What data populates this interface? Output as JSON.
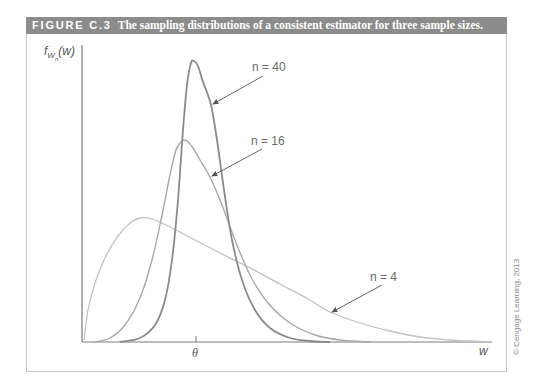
{
  "figure": {
    "number": "FIGURE C.3",
    "title": "The sampling distributions of a consistent estimator for three sample sizes.",
    "copyright": "© Cengage Learning, 2013"
  },
  "axes": {
    "ylabel_main": "f",
    "ylabel_sub": "W",
    "ylabel_subsub": "n",
    "ylabel_arg": "(w)",
    "xlabel": "w",
    "xtick_label": "θ"
  },
  "colors": {
    "header_bg": "#8c8c8c",
    "curve_n40": "#8a8a8a",
    "curve_n16": "#a8a8a8",
    "curve_n4": "#c2c2c2",
    "axis": "#7a7a7a"
  },
  "chart_data": {
    "type": "line",
    "title": "The sampling distributions of a consistent estimator for three sample sizes.",
    "xlabel": "w",
    "ylabel": "f_{W_n}(w)",
    "x_ticks": [
      "θ"
    ],
    "grid": false,
    "legend_position": "inline annotations with arrows",
    "annotations": [
      "n = 40",
      "n = 16",
      "n = 4"
    ],
    "series": [
      {
        "name": "n = 40",
        "label": "n = 40",
        "description": "Tall, narrow density centered at θ",
        "points": [
          [
            120,
            342
          ],
          [
            140,
            338
          ],
          [
            155,
            325
          ],
          [
            165,
            300
          ],
          [
            172,
            260
          ],
          [
            178,
            200
          ],
          [
            183,
            130
          ],
          [
            187,
            85
          ],
          [
            191,
            63
          ],
          [
            194,
            61
          ],
          [
            198,
            66
          ],
          [
            203,
            82
          ],
          [
            211,
            105
          ],
          [
            217,
            140
          ],
          [
            224,
            190
          ],
          [
            232,
            240
          ],
          [
            242,
            280
          ],
          [
            255,
            310
          ],
          [
            270,
            328
          ],
          [
            290,
            338
          ],
          [
            310,
            341
          ],
          [
            330,
            342
          ]
        ]
      },
      {
        "name": "n = 16",
        "label": "n = 16",
        "description": "Moderately peaked density near θ",
        "points": [
          [
            95,
            342
          ],
          [
            110,
            338
          ],
          [
            125,
            325
          ],
          [
            140,
            298
          ],
          [
            152,
            260
          ],
          [
            162,
            215
          ],
          [
            170,
            175
          ],
          [
            176,
            150
          ],
          [
            182,
            141
          ],
          [
            187,
            141
          ],
          [
            193,
            148
          ],
          [
            200,
            160
          ],
          [
            210,
            177
          ],
          [
            222,
            205
          ],
          [
            235,
            240
          ],
          [
            250,
            275
          ],
          [
            268,
            303
          ],
          [
            290,
            323
          ],
          [
            315,
            335
          ],
          [
            340,
            340
          ],
          [
            370,
            342
          ]
        ]
      },
      {
        "name": "n = 4",
        "label": "n = 4",
        "description": "Flat, spread-out skewed density",
        "points": [
          [
            84,
            340
          ],
          [
            88,
            310
          ],
          [
            95,
            283
          ],
          [
            105,
            258
          ],
          [
            118,
            236
          ],
          [
            130,
            223
          ],
          [
            140,
            218
          ],
          [
            152,
            219
          ],
          [
            170,
            227
          ],
          [
            195,
            240
          ],
          [
            220,
            253
          ],
          [
            250,
            268
          ],
          [
            280,
            284
          ],
          [
            310,
            300
          ],
          [
            330,
            312
          ],
          [
            360,
            323
          ],
          [
            390,
            331
          ],
          [
            420,
            337
          ],
          [
            450,
            340
          ],
          [
            470,
            341
          ],
          [
            492,
            342
          ]
        ]
      }
    ]
  }
}
